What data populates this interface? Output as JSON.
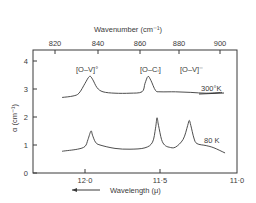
{
  "chart_data": {
    "type": "line",
    "title": "",
    "xlabel": "Wavelength (μ)",
    "xlabel_arrow": "←",
    "x2label": "Wavenumber (cm⁻¹)",
    "ylabel": "α (cm⁻¹)",
    "xlim": [
      12.2,
      11.0
    ],
    "ylim": [
      0,
      4.4
    ],
    "grid": false,
    "legend": "none (curves labelled inline)",
    "x_ticks": [
      "12.0",
      "11.5",
      "11.0"
    ],
    "x_tick_labels_display": [
      "12·0",
      "11·5",
      "11·0"
    ],
    "x2_ticks": [
      "820",
      "840",
      "860",
      "880",
      "900"
    ],
    "y_ticks": [
      "0",
      "1",
      "2",
      "3",
      "4"
    ],
    "annotations": [
      {
        "text": "[O–V]°",
        "near_x": 11.97,
        "y": 3.75
      },
      {
        "text": "[O–Cᵢ]",
        "near_x": 11.58,
        "y": 3.75
      },
      {
        "text": "[O–V]⁻",
        "near_x": 11.32,
        "y": 3.75
      },
      {
        "text": "300°K",
        "series": "300K"
      },
      {
        "text": "80 K",
        "series": "80K"
      }
    ],
    "series": [
      {
        "name": "300K",
        "label": "300°K",
        "x": [
          12.15,
          12.08,
          12.04,
          12.0,
          11.97,
          11.95,
          11.92,
          11.88,
          11.8,
          11.7,
          11.62,
          11.6,
          11.58,
          11.56,
          11.53,
          11.5,
          11.4,
          11.3,
          11.2,
          11.1
        ],
        "y": [
          2.7,
          2.75,
          2.85,
          3.2,
          3.45,
          3.35,
          3.05,
          2.9,
          2.85,
          2.85,
          2.9,
          3.2,
          3.45,
          3.3,
          2.95,
          2.9,
          2.9,
          2.88,
          2.85,
          2.88
        ]
      },
      {
        "name": "80K",
        "label": "80 K",
        "x": [
          12.15,
          12.05,
          12.0,
          11.98,
          11.96,
          11.95,
          11.93,
          11.9,
          11.8,
          11.7,
          11.6,
          11.55,
          11.53,
          11.52,
          11.51,
          11.49,
          11.47,
          11.44,
          11.4,
          11.35,
          11.32,
          11.31,
          11.3,
          11.28,
          11.26,
          11.2,
          11.15,
          11.08
        ],
        "y": [
          0.78,
          0.85,
          0.95,
          1.2,
          1.5,
          1.35,
          1.1,
          1.0,
          0.88,
          0.85,
          0.9,
          1.1,
          1.6,
          1.97,
          1.7,
          1.2,
          1.0,
          0.92,
          0.92,
          1.2,
          1.7,
          1.88,
          1.7,
          1.25,
          1.05,
          0.98,
          0.9,
          0.72
        ]
      }
    ]
  }
}
